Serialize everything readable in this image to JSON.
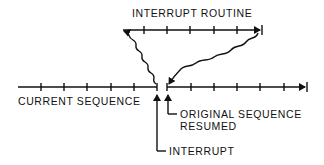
{
  "diagram": {
    "labels": {
      "interrupt_routine": "INTERRUPT ROUTINE",
      "current_sequence": "CURRENT SEQUENCE",
      "original_sequence_line1": "ORIGINAL SEQUENCE",
      "original_sequence_line2": "RESUMED",
      "interrupt": "INTERRUPT"
    },
    "colors": {
      "ink": "#111111",
      "background": "#ffffff"
    },
    "main_timeline": {
      "y": 87,
      "left_segment": [
        18,
        157
      ],
      "right_segment": [
        167,
        307
      ],
      "left_ticks": [
        41,
        64,
        87,
        111,
        134
      ],
      "right_ticks": [
        214,
        237,
        260,
        284
      ]
    },
    "routine_timeline": {
      "y": 30,
      "x": [
        121,
        262
      ],
      "ticks": [
        144,
        167,
        190,
        214,
        237
      ]
    }
  }
}
